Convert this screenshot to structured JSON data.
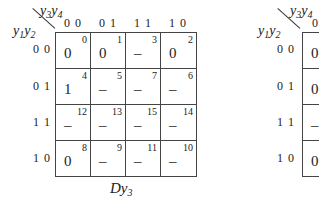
{
  "maps": [
    {
      "col_var": {
        "a": "y",
        "a_sub": "3",
        "b": "y",
        "b_sub": "4"
      },
      "row_var": {
        "a": "y",
        "a_sub": "1",
        "b": "y",
        "b_sub": "2"
      },
      "col_labels": [
        "0 0",
        "0 1",
        "1 1",
        "1 0"
      ],
      "row_labels": [
        "0 0",
        "0 1",
        "1 1",
        "1 0"
      ],
      "cells": [
        [
          {
            "idx": "0",
            "val": "0"
          },
          {
            "idx": "1",
            "val": "0"
          },
          {
            "idx": "3",
            "val": "–"
          },
          {
            "idx": "2",
            "val": "0"
          }
        ],
        [
          {
            "idx": "4",
            "val": "1"
          },
          {
            "idx": "5",
            "val": "–"
          },
          {
            "idx": "7",
            "val": "–"
          },
          {
            "idx": "6",
            "val": "–"
          }
        ],
        [
          {
            "idx": "12",
            "val": "–"
          },
          {
            "idx": "13",
            "val": "–"
          },
          {
            "idx": "15",
            "val": "–"
          },
          {
            "idx": "14",
            "val": "–"
          }
        ],
        [
          {
            "idx": "8",
            "val": "0"
          },
          {
            "idx": "9",
            "val": "–"
          },
          {
            "idx": "11",
            "val": "–"
          },
          {
            "idx": "10",
            "val": "–"
          }
        ]
      ],
      "caption": {
        "main": "Dy",
        "sub": "3"
      }
    },
    {
      "col_var": {
        "a": "y",
        "a_sub": "3",
        "b": "y",
        "b_sub": "4"
      },
      "row_var": {
        "a": "y",
        "a_sub": "1",
        "b": "y",
        "b_sub": "2"
      },
      "col_labels": [
        "0"
      ],
      "row_labels": [
        "0 0",
        "0 1",
        "1 1",
        "1 0"
      ],
      "cells": [
        [
          {
            "val": "0"
          }
        ],
        [
          {
            "val": "0"
          }
        ],
        [
          {
            "val": "–"
          }
        ],
        [
          {
            "val": "0"
          }
        ]
      ]
    }
  ]
}
